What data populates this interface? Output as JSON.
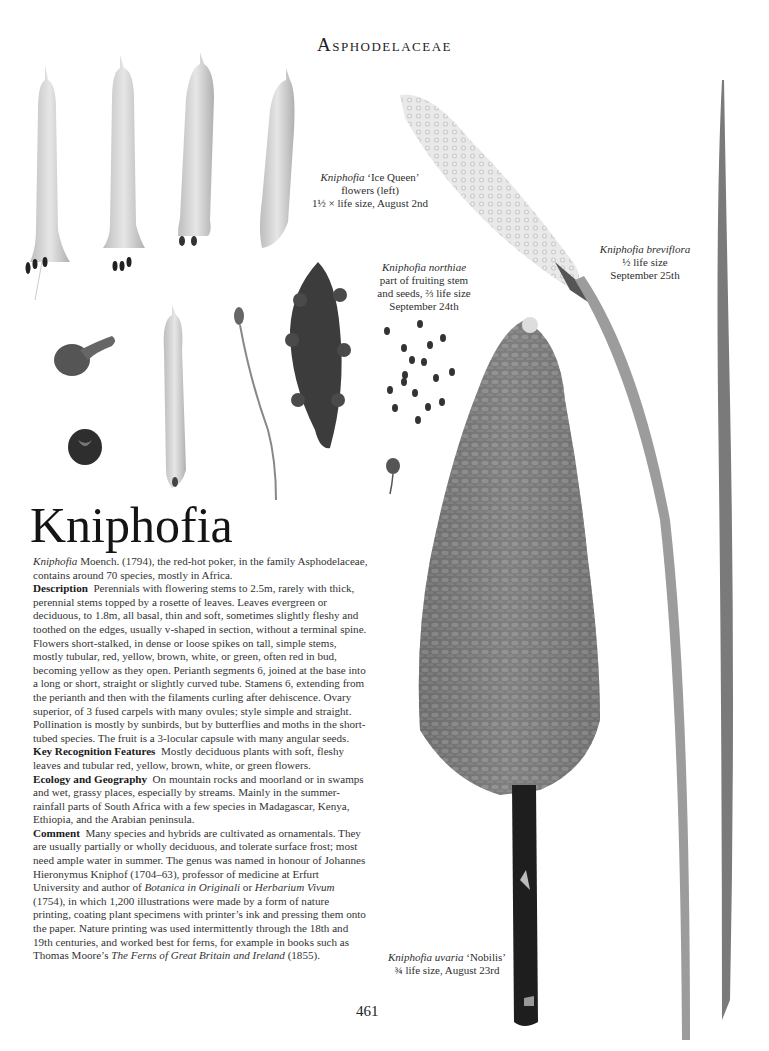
{
  "header": {
    "family": "Asphodelaceae"
  },
  "captions": {
    "ice_queen": {
      "species": "Kniphofia",
      "cultivar": "‘Ice Queen’",
      "line2": "flowers (left)",
      "line3": "1½ × life size, August 2nd"
    },
    "northiae": {
      "species": "Kniphofia northiae",
      "line2": "part of fruiting stem",
      "line3": "and seeds, ⅔ life size",
      "line4": "September 24th"
    },
    "breviflora": {
      "species": "Kniphofia breviflora",
      "line2": "½ life size",
      "line3": "September 25th"
    },
    "uvaria": {
      "species": "Kniphofia uvaria",
      "cultivar": "‘Nobilis’",
      "line2": "¾ life size, August 23rd"
    }
  },
  "article": {
    "title": "Kniphofia",
    "intro_species": "Kniphofia",
    "intro": " Moench. (1794), the red-hot poker, in the family Asphodelaceae, contains around 70 species, mostly in Africa.",
    "sections": [
      {
        "heading": "Description",
        "text": "Perennials with flowering stems to 2.5m, rarely with thick, perennial stems topped by a rosette of leaves. Leaves evergreen or deciduous, to 1.8m, all basal, thin and soft, sometimes slightly fleshy and toothed on the edges, usually v-shaped in section, without a terminal spine. Flowers short-stalked, in dense or loose spikes on tall, simple stems, mostly tubular, red, yellow, brown, white, or green, often red in bud, becoming yellow as they open. Perianth segments 6, joined at the base into a long or short, straight or slightly curved tube. Stamens 6, extending from the perianth and then with the filaments curling after dehiscence. Ovary superior, of 3 fused carpels with many ovules; style simple and straight. Pollination is mostly by sunbirds, but by butterflies and moths in the short-tubed species. The fruit is a 3-locular capsule with many angular seeds."
      },
      {
        "heading": "Key Recognition Features",
        "text": "Mostly deciduous plants with soft, fleshy leaves and tubular red, yellow, brown, white, or green flowers."
      },
      {
        "heading": "Ecology and Geography",
        "text": "On mountain rocks and moorland or in swamps and wet, grassy places, especially by streams. Mainly in the summer-rainfall parts of South Africa with a few species in Madagascar, Kenya, Ethiopia, and the Arabian peninsula."
      }
    ],
    "comment": {
      "heading": "Comment",
      "part1": "Many species and hybrids are cultivated as ornamentals. They are usually partially or wholly deciduous, and tolerate surface frost; most need ample water in summer. The genus was named in honour of Johannes Hieronymus Kniphof (1704–63), professor of medicine at Erfurt University and author of ",
      "book1": "Botanica in Originali",
      "part2": " or ",
      "book2": "Herbarium Vivum",
      "part3": " (1754), in which 1,200 illustrations were made by a form of nature printing, coating plant specimens with printer’s ink and pressing them onto the paper. Nature printing was used intermittently through the 18th and 19th centuries, and worked best for ferns, for example in books such as Thomas Moore’s ",
      "book3": "The Ferns of Great Britain and Ireland",
      "part4": " (1855)."
    }
  },
  "footer": {
    "page_number": "461"
  },
  "colors": {
    "ink": "#2a2a2a",
    "background": "#ffffff",
    "plant_dark": "#3a3a3a",
    "plant_mid": "#8a8a8a",
    "plant_light": "#d8d8d8"
  }
}
